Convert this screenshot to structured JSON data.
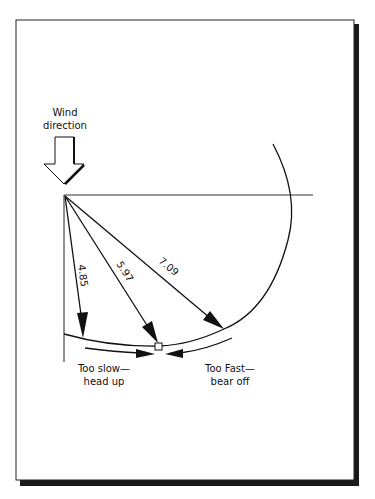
{
  "diagram": {
    "wind_label_line1": "Wind",
    "wind_label_line2": "direction",
    "vectors": [
      {
        "label": "4.85"
      },
      {
        "label": "5.97"
      },
      {
        "label": "7.09"
      }
    ],
    "left_note_line1": "Too slow—",
    "left_note_line2": "head up",
    "right_note_line1": "Too Fast—",
    "right_note_line2": "bear off",
    "colors": {
      "ink": "#111111",
      "shadow": "#1a1a1a",
      "background": "#ffffff"
    }
  }
}
